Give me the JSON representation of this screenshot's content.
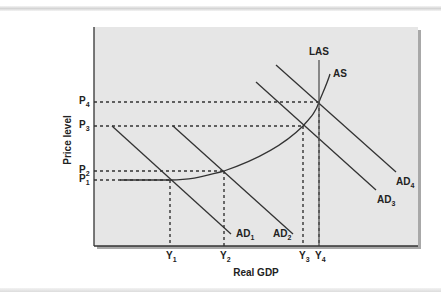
{
  "chart_data": {
    "type": "line",
    "title": "",
    "xlabel": "Real GDP",
    "ylabel": "Price level",
    "grid": false,
    "legend": "inline curve labels",
    "x_ticks": [
      {
        "label": "Y",
        "sub": "1",
        "x": 170
      },
      {
        "label": "Y",
        "sub": "2",
        "x": 224
      },
      {
        "label": "Y",
        "sub": "3",
        "x": 303
      },
      {
        "label": "Y",
        "sub": "4",
        "x": 319
      }
    ],
    "y_ticks": [
      {
        "label": "P",
        "sub": "4",
        "y": 102
      },
      {
        "label": "P",
        "sub": "3",
        "y": 126
      },
      {
        "label": "P",
        "sub": "2",
        "y": 171
      },
      {
        "label": "P",
        "sub": "1",
        "y": 180
      }
    ],
    "series": [
      {
        "name": "AD",
        "sub": "1",
        "type": "line",
        "points": [
          [
            112,
            126
          ],
          [
            231,
            234
          ]
        ],
        "label_pos": [
          236,
          237
        ]
      },
      {
        "name": "AD",
        "sub": "2",
        "type": "line",
        "points": [
          [
            173,
            126
          ],
          [
            293,
            234
          ]
        ],
        "label_pos": [
          273,
          237
        ]
      },
      {
        "name": "AD",
        "sub": "3",
        "type": "line",
        "points": [
          [
            256,
            82
          ],
          [
            376,
            190
          ]
        ],
        "label_pos": [
          377,
          203
        ]
      },
      {
        "name": "AD",
        "sub": "4",
        "type": "line",
        "points": [
          [
            276,
            65
          ],
          [
            396,
            172
          ]
        ],
        "label_pos": [
          396,
          185
        ]
      },
      {
        "name": "AS",
        "sub": "",
        "type": "curve",
        "points": [
          [
            120,
            180
          ],
          [
            170,
            180
          ],
          [
            224,
            171
          ],
          [
            303,
            126
          ],
          [
            319,
            102
          ],
          [
            330,
            74
          ]
        ],
        "label_pos": [
          333,
          77
        ]
      },
      {
        "name": "LAS",
        "sub": "",
        "type": "vertical",
        "x": 319,
        "y_top": 60,
        "label_pos": [
          309,
          55
        ]
      }
    ],
    "equilibria": [
      {
        "price": "P1",
        "output": "Y1",
        "point": [
          170,
          180
        ]
      },
      {
        "price": "P2",
        "output": "Y2",
        "point": [
          224,
          171
        ]
      },
      {
        "price": "P3",
        "output": "Y3",
        "point": [
          303,
          126
        ]
      },
      {
        "price": "P4",
        "output": "Y4",
        "point": [
          319,
          102
        ]
      }
    ],
    "plot_area": {
      "x0": 94,
      "y0": 27,
      "x1": 418,
      "y1": 246
    },
    "colors": {
      "plot_bg": "#e6e6e6",
      "line": "#333333",
      "shadow": "#9a9a9a"
    }
  }
}
